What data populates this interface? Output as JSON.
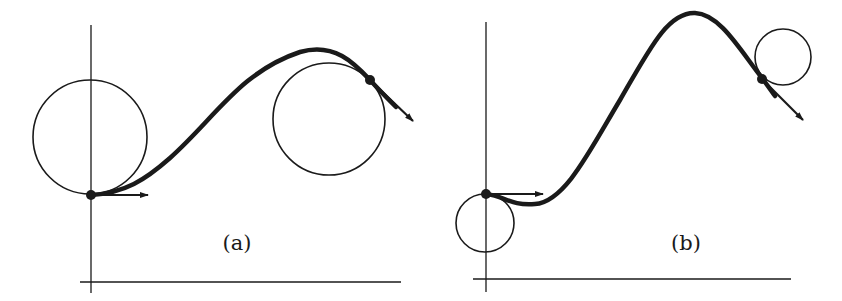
{
  "colors": {
    "ink": "#1a1a1a",
    "background": "#ffffff"
  },
  "panels": [
    {
      "id": "a",
      "label": "(a)",
      "label_pos": [
        237,
        250
      ],
      "axes": {
        "vertical": {
          "x": 91,
          "y1": 25,
          "y2": 293
        },
        "horizontal": {
          "y": 282,
          "x1": 80,
          "x2": 401
        }
      },
      "curve_path": "M 91 195 C 125 193, 145 180, 170 158 C 215 118, 240 72, 300 52 C 335 42, 355 64, 370 80 C 380 91, 390 101, 396 107",
      "start_point": [
        91,
        195
      ],
      "start_circle": {
        "cx": 90,
        "cy": 137,
        "r": 57
      },
      "start_arrow": {
        "x1": 91,
        "y1": 195,
        "x2": 148,
        "y2": 195
      },
      "end_point": [
        370,
        80
      ],
      "end_circle": {
        "cx": 329,
        "cy": 119,
        "r": 56
      },
      "end_arrow": {
        "x1": 370,
        "y1": 80,
        "x2": 413,
        "y2": 121
      }
    },
    {
      "id": "b",
      "label": "(b)",
      "label_pos": [
        686,
        250
      ],
      "axes": {
        "vertical": {
          "x": 486,
          "y1": 22,
          "y2": 292
        },
        "horizontal": {
          "y": 279,
          "x1": 473,
          "x2": 791
        }
      },
      "curve_path": "M 486 194 C 505 196, 510 206, 535 204 C 565 202, 590 150, 620 100 C 650 48, 668 12, 695 13 C 720 14, 740 50, 762 78 C 768 86, 772 92, 775 96",
      "start_point": [
        486,
        194
      ],
      "start_circle": {
        "cx": 485,
        "cy": 223,
        "r": 29
      },
      "start_arrow": {
        "x1": 486,
        "y1": 194,
        "x2": 543,
        "y2": 194
      },
      "end_point": [
        762,
        79
      ],
      "end_circle": {
        "cx": 783,
        "cy": 57,
        "r": 28
      },
      "end_arrow": {
        "x1": 762,
        "y1": 79,
        "x2": 803,
        "y2": 120
      }
    }
  ]
}
